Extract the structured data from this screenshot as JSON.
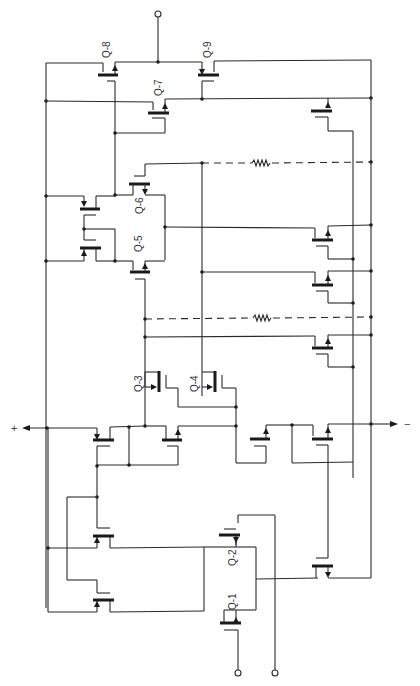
{
  "diagram": {
    "type": "transistor circuit schematic (rotated 90°)",
    "transistor_labels": {
      "q1": "Q-1",
      "q2": "Q-2",
      "q3": "Q-3",
      "q4": "Q-4",
      "q5": "Q-5",
      "q6": "Q-6",
      "q7": "Q-7",
      "q8": "Q-8",
      "q9": "Q-9"
    },
    "output_labels": {
      "positive": "+",
      "negative": "−"
    },
    "terminals": {
      "top": "top input terminal",
      "bottom_left": "Q-1 input terminal",
      "bottom_right": "Q-2 input terminal"
    },
    "resistors": [
      {
        "name": "upper resistor (dashed)"
      },
      {
        "name": "lower resistor (dashed)"
      }
    ],
    "colors": {
      "ink": "#2a2a2a",
      "background": "#ffffff"
    }
  }
}
